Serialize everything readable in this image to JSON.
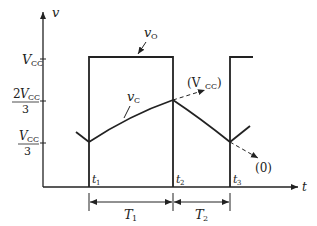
{
  "diagram": {
    "type": "555 astable timing waveform",
    "axes": {
      "y_label": "v",
      "x_label": "t"
    },
    "y_ticks": [
      {
        "main": "V",
        "sub": "CC",
        "prefix": "",
        "denominator": ""
      },
      {
        "main": "V",
        "sub": "CC",
        "prefix": "2",
        "denominator": "3"
      },
      {
        "main": "V",
        "sub": "CC",
        "prefix": "",
        "denominator": "3"
      }
    ],
    "time_marks": [
      {
        "main": "t",
        "sub": "1"
      },
      {
        "main": "t",
        "sub": "2"
      },
      {
        "main": "t",
        "sub": "3"
      }
    ],
    "intervals": [
      {
        "main": "T",
        "sub": "1"
      },
      {
        "main": "T",
        "sub": "2"
      }
    ],
    "signals": {
      "output": {
        "main": "v",
        "sub": "O"
      },
      "capacitor": {
        "main": "v",
        "sub": "C"
      }
    },
    "asymptotes": {
      "charge_target": "(V",
      "charge_target_sub": "CC",
      "charge_target_close": ")",
      "discharge_target": "(0)"
    }
  }
}
